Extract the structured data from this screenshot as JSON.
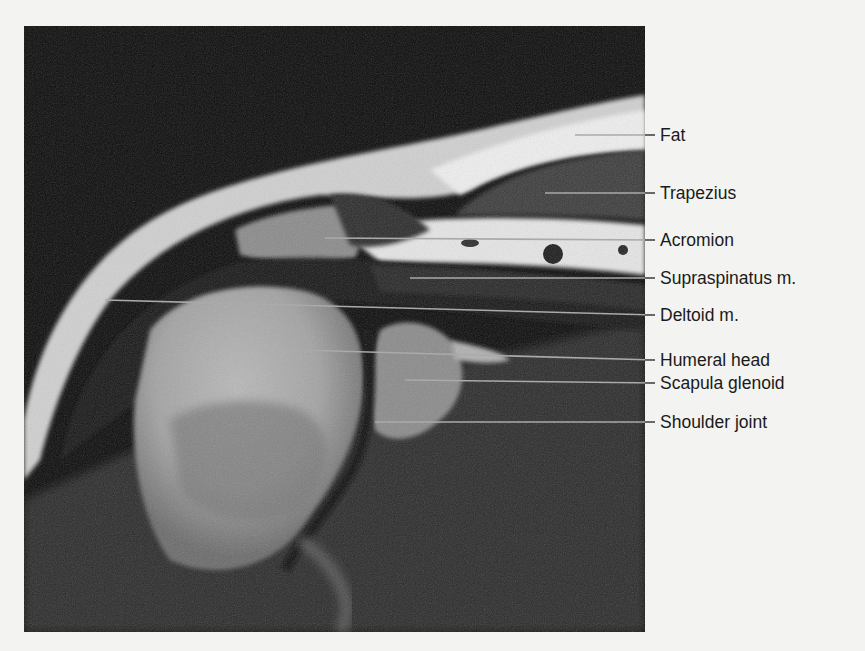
{
  "figure": {
    "type": "Shoulder MRI, coronal plane, labeled anatomy",
    "labels": [
      {
        "text": "Fat",
        "y": 135
      },
      {
        "text": "Trapezius",
        "y": 193
      },
      {
        "text": "Acromion",
        "y": 240
      },
      {
        "text": "Supraspinatus m.",
        "y": 278
      },
      {
        "text": "Deltoid m.",
        "y": 315
      },
      {
        "text": "Humeral head",
        "y": 360
      },
      {
        "text": "Scapula glenoid",
        "y": 383
      },
      {
        "text": "Shoulder joint",
        "y": 422
      }
    ]
  }
}
